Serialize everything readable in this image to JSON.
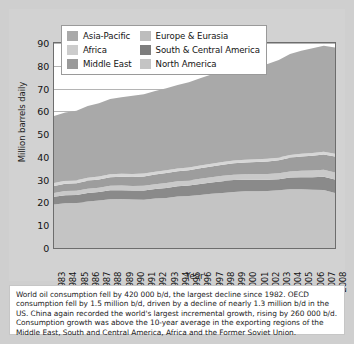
{
  "chart_data": {
    "type": "area",
    "title": "",
    "subtitle": "",
    "xlabel": "Year",
    "ylabel": "Million barrels daily",
    "stacked": true,
    "grid": true,
    "legend_position": "top-left-inside",
    "xlim": [
      1983,
      2008
    ],
    "ylim": [
      0,
      90
    ],
    "yticks": [
      0,
      10,
      20,
      30,
      40,
      50,
      60,
      70,
      80,
      90
    ],
    "categories": [
      1983,
      1984,
      1985,
      1986,
      1987,
      1988,
      1989,
      1990,
      1991,
      1992,
      1993,
      1994,
      1995,
      1996,
      1997,
      1998,
      1999,
      2000,
      2001,
      2002,
      2003,
      2004,
      2005,
      2006,
      2007,
      2008
    ],
    "series": [
      {
        "name": "North America",
        "color": "#c4c4c4",
        "values": [
          19.1,
          19.7,
          19.8,
          20.4,
          20.8,
          21.4,
          21.5,
          21.3,
          21.2,
          21.7,
          22.0,
          22.6,
          22.8,
          23.3,
          23.8,
          24.1,
          24.6,
          24.9,
          24.9,
          25.0,
          25.3,
          25.8,
          25.8,
          25.6,
          25.5,
          24.2
        ]
      },
      {
        "name": "South & Central America",
        "color": "#8a8a8a",
        "values": [
          3.4,
          3.5,
          3.5,
          3.7,
          3.8,
          3.9,
          3.9,
          3.9,
          4.0,
          4.2,
          4.3,
          4.5,
          4.6,
          4.8,
          5.0,
          5.2,
          5.2,
          5.1,
          5.1,
          5.0,
          4.9,
          5.1,
          5.3,
          5.5,
          5.8,
          5.9
        ]
      },
      {
        "name": "Africa",
        "color": "#c9c9c9",
        "values": [
          1.7,
          1.8,
          1.8,
          1.9,
          1.9,
          2.0,
          2.0,
          2.0,
          2.1,
          2.1,
          2.2,
          2.2,
          2.2,
          2.3,
          2.3,
          2.4,
          2.4,
          2.4,
          2.5,
          2.5,
          2.6,
          2.7,
          2.8,
          2.9,
          3.0,
          3.1
        ]
      },
      {
        "name": "Middle East",
        "color": "#9d9d9d",
        "values": [
          3.0,
          3.2,
          3.3,
          3.5,
          3.6,
          3.8,
          3.9,
          4.0,
          4.1,
          4.3,
          4.4,
          4.4,
          4.5,
          4.6,
          4.7,
          4.9,
          5.0,
          5.1,
          5.3,
          5.5,
          5.7,
          6.0,
          6.3,
          6.5,
          6.8,
          7.0
        ]
      },
      {
        "name": "Europe & Eurasia",
        "color": "#d6d6d6",
        "values": [
          1.3,
          1.3,
          1.3,
          1.3,
          1.3,
          1.3,
          1.3,
          1.3,
          1.3,
          1.2,
          1.2,
          1.2,
          1.2,
          1.2,
          1.2,
          1.2,
          1.2,
          1.2,
          1.2,
          1.2,
          1.2,
          1.2,
          1.2,
          1.2,
          1.2,
          1.2
        ]
      },
      {
        "name": "Asia-Pacific",
        "color": "#a9a9a9",
        "values": [
          29.5,
          30.0,
          30.6,
          31.5,
          32.2,
          33.0,
          33.6,
          34.3,
          34.8,
          35.4,
          36.0,
          36.7,
          37.5,
          38.3,
          39.2,
          38.8,
          39.6,
          40.6,
          41.1,
          41.6,
          42.8,
          44.4,
          45.2,
          46.0,
          46.5,
          46.6
        ]
      }
    ],
    "totals": [
      58.0,
      59.5,
      60.3,
      62.3,
      63.6,
      65.4,
      66.2,
      66.8,
      67.5,
      68.9,
      70.1,
      71.6,
      72.8,
      74.5,
      76.2,
      76.6,
      78.0,
      79.3,
      80.1,
      80.8,
      82.5,
      85.2,
      86.6,
      87.7,
      88.8,
      88.0
    ]
  },
  "legend": {
    "items": [
      {
        "label": "Asia-Pacific",
        "color": "#a9a9a9"
      },
      {
        "label": "Europe & Eurasia",
        "color": "#bdbdbd"
      },
      {
        "label": "Africa",
        "color": "#cccccc"
      },
      {
        "label": "South & Central America",
        "color": "#7d7d7d"
      },
      {
        "label": "Middle East",
        "color": "#9a9a9a"
      },
      {
        "label": "North America",
        "color": "#c4c4c4"
      }
    ]
  },
  "axes": {
    "y_title": "Million barrels daily",
    "x_title": "Year",
    "y_ticks": [
      "90",
      "80",
      "70",
      "60",
      "50",
      "40",
      "30",
      "20",
      "10",
      "0"
    ],
    "x_ticks": [
      "1983",
      "1984",
      "1985",
      "1986",
      "1987",
      "1988",
      "1989",
      "1990",
      "1991",
      "1992",
      "1993",
      "1994",
      "1995",
      "1996",
      "1997",
      "1998",
      "1999",
      "2000",
      "2001",
      "2002",
      "2003",
      "2004",
      "2005",
      "2006",
      "2007",
      "2008"
    ]
  },
  "caption": {
    "text": "World oil consumption fell by 420 000 b/d, the largest decline since 1982. OECD consumption fell by 1.5 million b/d, driven by a decline of nearly 1.3 million b/d in the US. China again recorded the world's largest incremental growth, rising by 260 000 b/d. Consumption growth was above the 10-year average in the exporting regions of the Middle East, South and Central America, Africa and the Former Soviet Union."
  }
}
